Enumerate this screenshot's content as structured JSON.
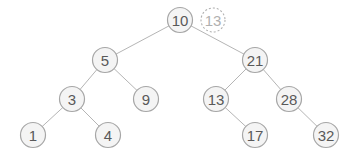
{
  "diagram": {
    "type": "binary-search-tree",
    "nodes": [
      {
        "id": "n10",
        "label": "10",
        "x": 180,
        "y": 20
      },
      {
        "id": "n5",
        "label": "5",
        "x": 105,
        "y": 60
      },
      {
        "id": "n21",
        "label": "21",
        "x": 255,
        "y": 60
      },
      {
        "id": "n3",
        "label": "3",
        "x": 72,
        "y": 99
      },
      {
        "id": "n9",
        "label": "9",
        "x": 146,
        "y": 99
      },
      {
        "id": "n13",
        "label": "13",
        "x": 216,
        "y": 99
      },
      {
        "id": "n28",
        "label": "28",
        "x": 289,
        "y": 99
      },
      {
        "id": "n1",
        "label": "1",
        "x": 33,
        "y": 135
      },
      {
        "id": "n4",
        "label": "4",
        "x": 108,
        "y": 135
      },
      {
        "id": "n17",
        "label": "17",
        "x": 255,
        "y": 135
      },
      {
        "id": "n32",
        "label": "32",
        "x": 326,
        "y": 135
      }
    ],
    "ghost_node": {
      "id": "g13",
      "label": "13",
      "x": 213,
      "y": 20,
      "style": "dashed"
    },
    "edges": [
      [
        "n10",
        "n5"
      ],
      [
        "n10",
        "n21"
      ],
      [
        "n5",
        "n3"
      ],
      [
        "n5",
        "n9"
      ],
      [
        "n21",
        "n13"
      ],
      [
        "n21",
        "n28"
      ],
      [
        "n3",
        "n1"
      ],
      [
        "n3",
        "n4"
      ],
      [
        "n13",
        "n17"
      ],
      [
        "n28",
        "n32"
      ]
    ],
    "node_radius": 12.5,
    "colors": {
      "node_fill": "#f4f4f4",
      "node_stroke": "#a6a6a6",
      "text": "#595959",
      "edge": "#b5b5b5",
      "ghost": "#b0b0b0"
    }
  }
}
